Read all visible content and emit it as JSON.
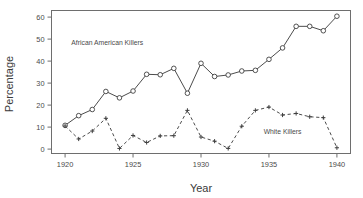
{
  "chart_data": {
    "type": "line",
    "title": "",
    "xlabel": "Year",
    "ylabel": "Percentage",
    "xlim": [
      1919,
      1941
    ],
    "ylim": [
      -2,
      63
    ],
    "xticks": [
      1920,
      1925,
      1930,
      1935,
      1940
    ],
    "xtick_labels": [
      "1920",
      "1925",
      "1930",
      "1935",
      "1940"
    ],
    "yticks": [
      0,
      10,
      20,
      30,
      40,
      50,
      60
    ],
    "ytick_labels": [
      "0",
      "10",
      "20",
      "30",
      "40",
      "50",
      "60"
    ],
    "grid": false,
    "legend_position": "inline-annotations",
    "x": [
      1920,
      1921,
      1922,
      1923,
      1924,
      1925,
      1926,
      1927,
      1928,
      1929,
      1930,
      1931,
      1932,
      1933,
      1934,
      1935,
      1936,
      1937,
      1938,
      1939,
      1940
    ],
    "series": [
      {
        "name": "African American Killers",
        "marker": "circle",
        "linestyle": "solid",
        "color": "#4c4c4c",
        "annotation_x": 1923.1,
        "annotation_y": 47.5,
        "values": [
          10.8,
          15.2,
          18.0,
          26.2,
          23.3,
          26.4,
          34.0,
          33.8,
          36.7,
          25.4,
          39.0,
          33.0,
          33.7,
          35.5,
          35.8,
          40.8,
          46.0,
          55.8,
          55.8,
          53.8,
          60.4
        ]
      },
      {
        "name": "White Killers",
        "marker": "plus",
        "linestyle": "dashed",
        "color": "#4c4c4c",
        "annotation_x": 1936.0,
        "annotation_y": 7.0,
        "values": [
          10.5,
          4.6,
          8.2,
          14.0,
          0.3,
          6.2,
          3.0,
          6.0,
          6.1,
          17.6,
          5.5,
          3.6,
          0.3,
          10.4,
          17.6,
          19.1,
          15.5,
          16.2,
          14.7,
          14.3,
          0.6
        ]
      }
    ]
  },
  "labels": {
    "xlabel": "Year",
    "ylabel": "Percentage",
    "series_1_annotation": "African American Killers",
    "series_2_annotation": "White Killers"
  },
  "colors": {
    "background": "#ffffff",
    "axis": "#6e6e6e",
    "line": "#4c4c4c",
    "text": "#4a4a4a"
  }
}
